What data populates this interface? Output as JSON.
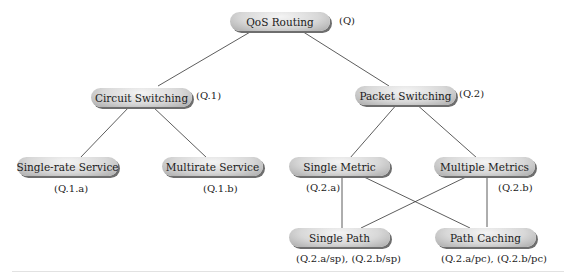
{
  "diagram": {
    "nodes": [
      {
        "id": "root",
        "label": "QoS Routing",
        "code": "(Q)"
      },
      {
        "id": "circuit",
        "label": "Circuit Switching",
        "code": "(Q.1)"
      },
      {
        "id": "packet",
        "label": "Packet Switching",
        "code": "(Q.2)"
      },
      {
        "id": "single_rate",
        "label": "Single-rate Service",
        "code": "(Q.1.a)"
      },
      {
        "id": "multirate",
        "label": "Multirate Service",
        "code": "(Q.1.b)"
      },
      {
        "id": "single_metric",
        "label": "Single Metric",
        "code": "(Q.2.a)"
      },
      {
        "id": "multiple_metrics",
        "label": "Multiple Metrics",
        "code": "(Q.2.b)"
      },
      {
        "id": "single_path",
        "label": "Single Path",
        "code": "(Q.2.a/sp), (Q.2.b/sp)"
      },
      {
        "id": "path_caching",
        "label": "Path Caching",
        "code": "(Q.2.a/pc), (Q.2.b/pc)"
      }
    ],
    "edges": [
      [
        "root",
        "circuit"
      ],
      [
        "root",
        "packet"
      ],
      [
        "circuit",
        "single_rate"
      ],
      [
        "circuit",
        "multirate"
      ],
      [
        "packet",
        "single_metric"
      ],
      [
        "packet",
        "multiple_metrics"
      ],
      [
        "single_metric",
        "single_path"
      ],
      [
        "single_metric",
        "path_caching"
      ],
      [
        "multiple_metrics",
        "single_path"
      ],
      [
        "multiple_metrics",
        "path_caching"
      ]
    ]
  }
}
